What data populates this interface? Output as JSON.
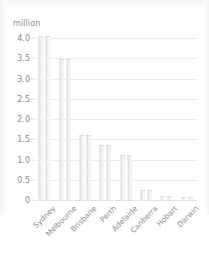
{
  "chart_data": {
    "type": "bar",
    "title": "",
    "subtitle": "",
    "xlabel": "",
    "ylabel": "million",
    "unit_caption": "million",
    "categories": [
      "Sydney",
      "Melbourne",
      "Brisbane",
      "Perth",
      "Adelaide",
      "Canberra",
      "Hobart",
      "Darwin"
    ],
    "values": [
      4.05,
      3.48,
      1.61,
      1.35,
      1.1,
      0.25,
      0.09,
      0.07
    ],
    "series": [
      {
        "name": "Population",
        "values": [
          4.05,
          3.48,
          1.61,
          1.35,
          1.1,
          0.25,
          0.09,
          0.07
        ]
      }
    ],
    "ylim": [
      0,
      4.25
    ],
    "yticks": [
      0,
      0.5,
      1.0,
      1.5,
      2.0,
      2.5,
      3.0,
      3.5,
      4.0
    ],
    "ytick_labels": [
      "0",
      "0.5",
      "1.0",
      "1.5",
      "2.0",
      "2.5",
      "3.0",
      "3.5",
      "4.0"
    ],
    "grid": true,
    "legend": false,
    "legend_position": "none",
    "bars_per_category": 2,
    "xtick_label_rotation": -45,
    "colors": {
      "bar": "#e4e4e4",
      "bar_edge": "#dcdcdc",
      "grid": "#eceaea",
      "axis_text": "#8a8a8a",
      "background": "#ffffff"
    }
  }
}
